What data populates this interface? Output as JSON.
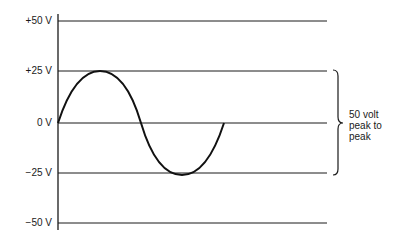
{
  "diagram": {
    "y_labels": [
      {
        "text": "+50 V",
        "y": 21
      },
      {
        "text": "+25 V",
        "y": 71
      },
      {
        "text": "0 V",
        "y": 123
      },
      {
        "text": "−25 V",
        "y": 173
      },
      {
        "text": "−50 V",
        "y": 223
      }
    ],
    "annotation": {
      "line1": "50 volt",
      "line2": "peak to",
      "line3": "peak"
    },
    "waveform": {
      "type": "sine",
      "cycles": 1,
      "amplitude_v": 25
    }
  }
}
